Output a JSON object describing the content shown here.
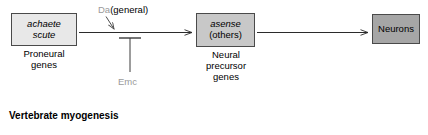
{
  "figure": {
    "caption": "Vertebrate myogenesis"
  },
  "nodes": {
    "proneural": {
      "gene_italic": "achaete",
      "gene_italic_2": "scute",
      "caption_line1": "Proneural",
      "caption_line2": "genes",
      "fill": "#e8e8e8"
    },
    "precursor": {
      "gene_italic": "asense",
      "gene_plain": "(others)",
      "caption_line1": "Neural",
      "caption_line2": "precursor",
      "caption_line3": "genes",
      "fill": "#c8c8c8"
    },
    "neurons": {
      "label": "Neurons",
      "fill": "#a6a6a6"
    }
  },
  "regulators": {
    "activator": {
      "name": "Da",
      "qualifier": "(general)",
      "name_color": "#9a9a9a",
      "qualifier_color": "#000000",
      "relation": "activates"
    },
    "inhibitor": {
      "name": "Emc",
      "color": "#9a9a9a",
      "relation": "inhibits"
    }
  },
  "edges": {
    "proneural_to_precursor": "arrow",
    "precursor_to_neurons": "arrow"
  }
}
